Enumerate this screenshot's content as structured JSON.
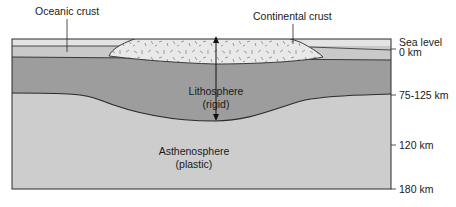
{
  "diagram": {
    "labels": {
      "oceanic_crust": "Oceanic crust",
      "continental_crust": "Continental crust",
      "lithosphere_line1": "Lithosphere",
      "lithosphere_line2": "(rigid)",
      "asthenosphere_line1": "Asthenosphere",
      "asthenosphere_line2": "(plastic)"
    },
    "depth_scale": [
      {
        "label": "Sea level"
      },
      {
        "label": "0 km"
      },
      {
        "label": "75-125 km"
      },
      {
        "label": "120 km"
      },
      {
        "label": "180 km"
      }
    ],
    "colors": {
      "ocean": "#e4e4e4",
      "oceanic_crust": "#c9c9c9",
      "continental_crust": "#e9e9e9",
      "lithosphere": "#9d9d9d",
      "asthenosphere": "#cdcdcd",
      "line": "#2a2a2a"
    }
  }
}
